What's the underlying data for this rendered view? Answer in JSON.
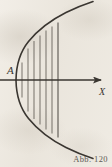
{
  "figure": {
    "caption": "Abb. 120",
    "caption_prefix": "Abb.",
    "caption_number": "120",
    "vertex_label": "A",
    "axis_label": "X",
    "background_color": "#eeeae2",
    "ink_color": "#3a3631"
  },
  "chart_data": {
    "type": "line",
    "title": "Abb. 120",
    "xlabel": "X",
    "ylabel": "",
    "grid": false,
    "legend": false,
    "annotations": [
      {
        "text": "A",
        "x": 16,
        "y": 80,
        "style": "italic",
        "role": "vertex-label"
      },
      {
        "text": "X",
        "x": 103,
        "y": 92,
        "style": "italic",
        "role": "axis-label"
      }
    ],
    "axes": [
      {
        "name": "x-axis",
        "orientation": "horizontal",
        "x_start": 0,
        "x_end": 104,
        "y": 80,
        "arrow": "end",
        "label": "X"
      }
    ],
    "series": [
      {
        "name": "parabola-upper-branch",
        "kind": "curve",
        "points": [
          [
            16,
            80
          ],
          [
            18,
            69
          ],
          [
            22,
            58
          ],
          [
            28,
            48
          ],
          [
            36,
            39
          ],
          [
            46,
            30
          ],
          [
            58,
            22
          ],
          [
            71,
            14
          ],
          [
            84,
            8
          ],
          [
            93,
            4
          ]
        ]
      },
      {
        "name": "parabola-lower-branch",
        "kind": "curve",
        "points": [
          [
            16,
            80
          ],
          [
            18,
            91
          ],
          [
            22,
            102
          ],
          [
            28,
            112
          ],
          [
            36,
            121
          ],
          [
            46,
            130
          ],
          [
            58,
            138
          ],
          [
            71,
            146
          ],
          [
            84,
            152
          ],
          [
            93,
            156
          ]
        ]
      }
    ],
    "hatching": {
      "name": "vertical-hatch-fill",
      "orientation": "vertical",
      "count": 7,
      "x_positions": [
        22,
        28,
        34,
        40,
        46,
        52,
        58
      ],
      "region": "between parabola vertex and vertical chord at x = 58"
    },
    "xlim": [
      0,
      112
    ],
    "ylim": [
      0,
      167
    ]
  }
}
